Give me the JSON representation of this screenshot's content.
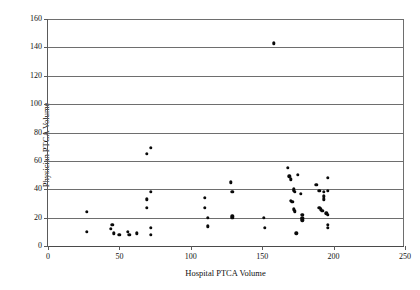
{
  "chart_data": {
    "type": "scatter",
    "title": "",
    "xlabel": "Hospital PTCA Volume",
    "ylabel": "Physician PTCA Volume",
    "xlim": [
      0,
      250
    ],
    "ylim": [
      0,
      160
    ],
    "xticks": [
      0,
      50,
      100,
      150,
      200,
      250
    ],
    "yticks": [
      0,
      20,
      40,
      60,
      80,
      100,
      120,
      140,
      160
    ],
    "xtick_labels": [
      "0",
      "50",
      "100",
      "150",
      "200",
      "250"
    ],
    "ytick_labels": [
      "0",
      "20",
      "40",
      "60",
      "80",
      "100",
      "120",
      "140",
      "160"
    ],
    "grid": "horizontal",
    "legend": "none",
    "marker": "filled-circle",
    "marker_color": "#0a0a0a",
    "points": [
      [
        27,
        24
      ],
      [
        27,
        10
      ],
      [
        44,
        12
      ],
      [
        45,
        15
      ],
      [
        46,
        9
      ],
      [
        50,
        8
      ],
      [
        56,
        10
      ],
      [
        57,
        8
      ],
      [
        62,
        9
      ],
      [
        69,
        65
      ],
      [
        72,
        69
      ],
      [
        69,
        33
      ],
      [
        72,
        38
      ],
      [
        69,
        27
      ],
      [
        72,
        13
      ],
      [
        72,
        8
      ],
      [
        110,
        34
      ],
      [
        110,
        27
      ],
      [
        112,
        20
      ],
      [
        112,
        14
      ],
      [
        128,
        45
      ],
      [
        129,
        38
      ],
      [
        129,
        21
      ],
      [
        129,
        20
      ],
      [
        151,
        20
      ],
      [
        152,
        13
      ],
      [
        158,
        143
      ],
      [
        168,
        55
      ],
      [
        169,
        49
      ],
      [
        170,
        47
      ],
      [
        172,
        40
      ],
      [
        172,
        39
      ],
      [
        173,
        38
      ],
      [
        170,
        32
      ],
      [
        171,
        31
      ],
      [
        172,
        26
      ],
      [
        173,
        25
      ],
      [
        173,
        24
      ],
      [
        175,
        50
      ],
      [
        177,
        37
      ],
      [
        178,
        22
      ],
      [
        178,
        20
      ],
      [
        178,
        19
      ],
      [
        178,
        18
      ],
      [
        174,
        9
      ],
      [
        188,
        43
      ],
      [
        190,
        39
      ],
      [
        193,
        38
      ],
      [
        193,
        35
      ],
      [
        193,
        33
      ],
      [
        190,
        27
      ],
      [
        191,
        26
      ],
      [
        192,
        25
      ],
      [
        196,
        48
      ],
      [
        196,
        39
      ],
      [
        195,
        23
      ],
      [
        196,
        22
      ],
      [
        196,
        15
      ],
      [
        196,
        13
      ]
    ]
  }
}
